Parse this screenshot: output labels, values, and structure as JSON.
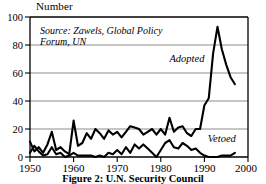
{
  "figure": {
    "axis_title": "Number",
    "caption": "Figure 2: U.N. Security Council",
    "source_line_1": "Source: Zawels, Global Policy",
    "source_line_2": "Forum, UN"
  },
  "colors": {
    "line": "#000000",
    "grid": "#808080",
    "frame": "#000000",
    "background": "#ffffff"
  },
  "chart_data": {
    "type": "line",
    "title": "Figure 2: U.N. Security Council",
    "xlabel": "",
    "ylabel": "Number",
    "xlim": [
      1950,
      2000
    ],
    "ylim": [
      0,
      100
    ],
    "xticks": [
      1950,
      1960,
      1970,
      1980,
      1990,
      2000
    ],
    "yticks": [
      0,
      20,
      40,
      60,
      80,
      100
    ],
    "grid": true,
    "legend_position": "inline-annotation",
    "annotations": [
      {
        "text": "Adopted",
        "x": 1986,
        "y": 68
      },
      {
        "text": "Vetoed",
        "x": 1994,
        "y": 11
      },
      {
        "text": "Source: Zawels, Global Policy",
        "x": 1952,
        "y": 93
      },
      {
        "text": "Forum, UN",
        "x": 1952,
        "y": 86
      }
    ],
    "x": [
      1950,
      1951,
      1952,
      1953,
      1954,
      1955,
      1956,
      1957,
      1958,
      1959,
      1960,
      1961,
      1962,
      1963,
      1964,
      1965,
      1966,
      1967,
      1968,
      1969,
      1970,
      1971,
      1972,
      1973,
      1974,
      1975,
      1976,
      1977,
      1978,
      1979,
      1980,
      1981,
      1982,
      1983,
      1984,
      1985,
      1986,
      1987,
      1988,
      1989,
      1990,
      1991,
      1992,
      1993,
      1994,
      1995,
      1996,
      1997
    ],
    "series": [
      {
        "name": "Adopted",
        "values": [
          11,
          4,
          7,
          3,
          9,
          18,
          5,
          7,
          4,
          2,
          26,
          8,
          10,
          17,
          13,
          20,
          17,
          13,
          19,
          16,
          18,
          14,
          18,
          22,
          21,
          20,
          16,
          18,
          20,
          16,
          20,
          16,
          28,
          18,
          21,
          22,
          17,
          15,
          20,
          20,
          37,
          42,
          74,
          93,
          77,
          66,
          57,
          52
        ]
      },
      {
        "name": "Vetoed",
        "values": [
          3,
          8,
          4,
          1,
          2,
          7,
          2,
          3,
          0,
          1,
          3,
          1,
          1,
          1,
          1,
          0,
          1,
          0,
          3,
          2,
          5,
          2,
          7,
          3,
          9,
          6,
          9,
          6,
          3,
          0,
          5,
          10,
          12,
          7,
          6,
          10,
          8,
          5,
          6,
          3,
          1,
          0,
          0,
          0,
          1,
          1,
          1,
          3
        ]
      }
    ]
  }
}
